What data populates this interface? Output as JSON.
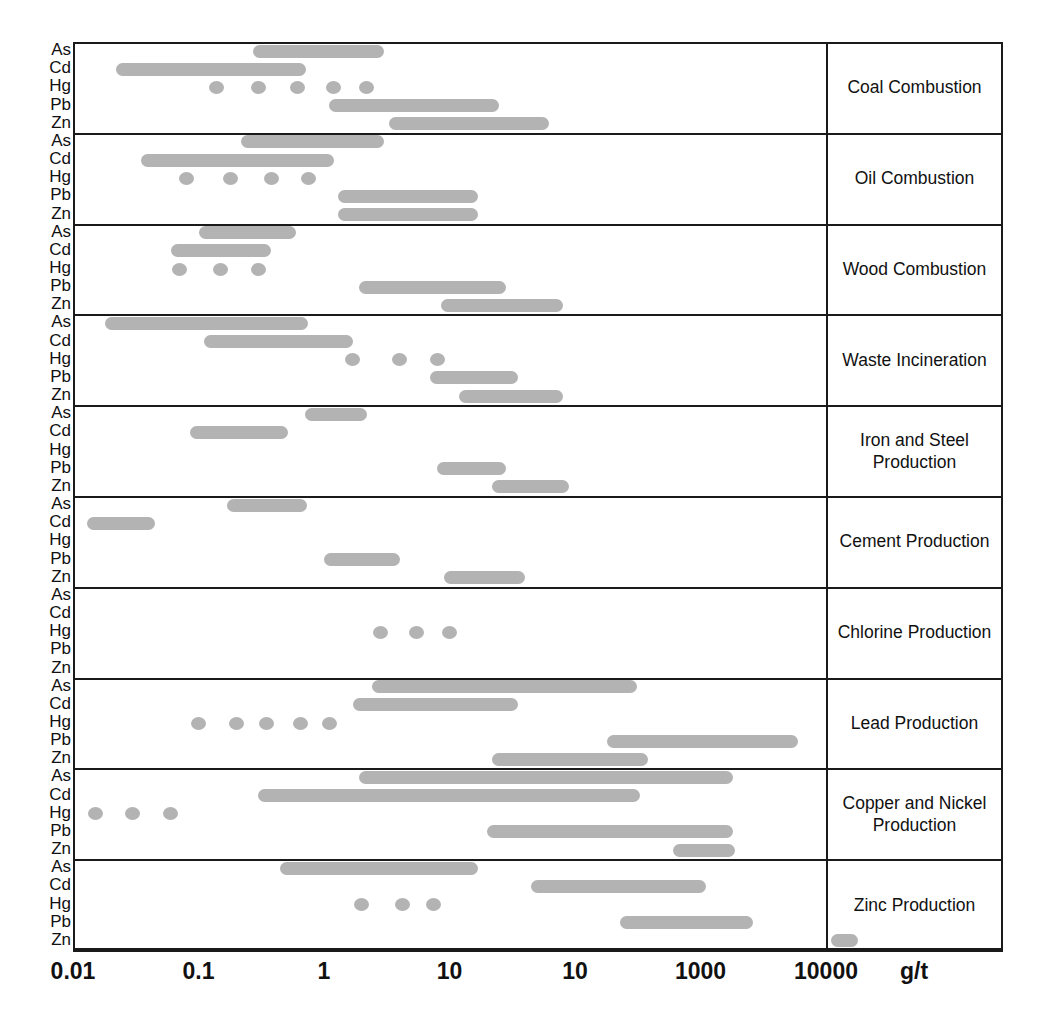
{
  "chart_data": {
    "type": "bar",
    "subtype": "horizontal-range-bars",
    "title": "",
    "xlabel": "g/t",
    "ylabel": "",
    "xscale": "log",
    "xlim": [
      0.01,
      100000
    ],
    "grid": false,
    "legend": "none",
    "axis_tick_labels": [
      "0.01",
      "0.1",
      "1",
      "10",
      "10",
      "1000",
      "10000"
    ],
    "axis_tick_values": [
      0.01,
      0.1,
      1,
      10,
      100,
      1000,
      10000
    ],
    "unit_label": "g/t",
    "metals": [
      "As",
      "Cd",
      "Hg",
      "Pb",
      "Zn"
    ],
    "note": "Fifth x tick is printed as '10' in the source figure although its position corresponds to 100.",
    "bar_color": "#b3b3b3",
    "frame_color": "#1a1a1a",
    "categories": [
      "Coal Combustion",
      "Oil Combustion",
      "Wood Combustion",
      "Waste Incineration",
      "Iron and Steel Production",
      "Cement Production",
      "Chlorine Production",
      "Lead Production",
      "Copper and Nickel Production",
      "Zinc Production"
    ],
    "series": [
      {
        "category": "Coal Combustion",
        "rows": [
          {
            "metal": "As",
            "style": "range",
            "min": 0.27,
            "max": 3.0
          },
          {
            "metal": "Cd",
            "style": "range",
            "min": 0.022,
            "max": 0.72
          },
          {
            "metal": "Hg",
            "style": "dots",
            "points": [
              0.14,
              0.3,
              0.62,
              1.2,
              2.2
            ]
          },
          {
            "metal": "Pb",
            "style": "range",
            "min": 1.1,
            "max": 25
          },
          {
            "metal": "Zn",
            "style": "range",
            "min": 3.3,
            "max": 62
          }
        ]
      },
      {
        "category": "Oil Combustion",
        "rows": [
          {
            "metal": "As",
            "style": "range",
            "min": 0.22,
            "max": 3.0
          },
          {
            "metal": "Cd",
            "style": "range",
            "min": 0.035,
            "max": 1.2
          },
          {
            "metal": "Hg",
            "style": "dots",
            "points": [
              0.08,
              0.18,
              0.38,
              0.75
            ]
          },
          {
            "metal": "Pb",
            "style": "range",
            "min": 1.3,
            "max": 17
          },
          {
            "metal": "Zn",
            "style": "range",
            "min": 1.3,
            "max": 17
          }
        ]
      },
      {
        "category": "Wood Combustion",
        "rows": [
          {
            "metal": "As",
            "style": "range",
            "min": 0.1,
            "max": 0.6
          },
          {
            "metal": "Cd",
            "style": "range",
            "min": 0.06,
            "max": 0.38
          },
          {
            "metal": "Hg",
            "style": "dots",
            "points": [
              0.07,
              0.15,
              0.3
            ]
          },
          {
            "metal": "Pb",
            "style": "range",
            "min": 1.9,
            "max": 28
          },
          {
            "metal": "Zn",
            "style": "range",
            "min": 8.5,
            "max": 80
          }
        ]
      },
      {
        "category": "Waste Incineration",
        "rows": [
          {
            "metal": "As",
            "style": "range",
            "min": 0.018,
            "max": 0.75
          },
          {
            "metal": "Cd",
            "style": "range",
            "min": 0.11,
            "max": 1.7
          },
          {
            "metal": "Hg",
            "style": "dots",
            "points": [
              1.7,
              4.0,
              8.0
            ]
          },
          {
            "metal": "Pb",
            "style": "range",
            "min": 7.0,
            "max": 35
          },
          {
            "metal": "Zn",
            "style": "range",
            "min": 12,
            "max": 80
          }
        ]
      },
      {
        "category": "Iron and Steel Production",
        "rows": [
          {
            "metal": "As",
            "style": "range",
            "min": 0.7,
            "max": 2.2
          },
          {
            "metal": "Cd",
            "style": "range",
            "min": 0.085,
            "max": 0.52
          },
          {
            "metal": "Hg",
            "style": "none",
            "points": []
          },
          {
            "metal": "Pb",
            "style": "range",
            "min": 8.0,
            "max": 28
          },
          {
            "metal": "Zn",
            "style": "range",
            "min": 22,
            "max": 90
          }
        ]
      },
      {
        "category": "Cement Production",
        "rows": [
          {
            "metal": "As",
            "style": "range",
            "min": 0.17,
            "max": 0.73
          },
          {
            "metal": "Cd",
            "style": "range",
            "min": 0.013,
            "max": 0.045
          },
          {
            "metal": "Hg",
            "style": "none",
            "points": []
          },
          {
            "metal": "Pb",
            "style": "range",
            "min": 1.0,
            "max": 4.0
          },
          {
            "metal": "Zn",
            "style": "range",
            "min": 9.0,
            "max": 40
          }
        ]
      },
      {
        "category": "Chlorine Production",
        "rows": [
          {
            "metal": "As",
            "style": "none",
            "points": []
          },
          {
            "metal": "Cd",
            "style": "none",
            "points": []
          },
          {
            "metal": "Hg",
            "style": "dots",
            "points": [
              2.8,
              5.5,
              10
            ]
          },
          {
            "metal": "Pb",
            "style": "none",
            "points": []
          },
          {
            "metal": "Zn",
            "style": "none",
            "points": []
          }
        ]
      },
      {
        "category": "Lead Production",
        "rows": [
          {
            "metal": "As",
            "style": "range",
            "min": 2.4,
            "max": 310
          },
          {
            "metal": "Cd",
            "style": "range",
            "min": 1.7,
            "max": 35
          },
          {
            "metal": "Hg",
            "style": "dots",
            "points": [
              0.1,
              0.2,
              0.35,
              0.65,
              1.1
            ]
          },
          {
            "metal": "Pb",
            "style": "range",
            "min": 180,
            "max": 6000
          },
          {
            "metal": "Zn",
            "style": "range",
            "min": 22,
            "max": 380
          }
        ]
      },
      {
        "category": "Copper and Nickel Production",
        "rows": [
          {
            "metal": "As",
            "style": "range",
            "min": 1.9,
            "max": 1800
          },
          {
            "metal": "Cd",
            "style": "range",
            "min": 0.3,
            "max": 330
          },
          {
            "metal": "Hg",
            "style": "dots",
            "points": [
              0.015,
              0.03,
              0.06
            ]
          },
          {
            "metal": "Pb",
            "style": "range",
            "min": 20,
            "max": 1800
          },
          {
            "metal": "Zn",
            "style": "range",
            "min": 600,
            "max": 1900
          }
        ]
      },
      {
        "category": "Zinc Production",
        "rows": [
          {
            "metal": "As",
            "style": "range",
            "min": 0.45,
            "max": 17
          },
          {
            "metal": "Cd",
            "style": "range",
            "min": 45,
            "max": 1100
          },
          {
            "metal": "Hg",
            "style": "dots",
            "points": [
              2.0,
              4.2,
              7.5
            ]
          },
          {
            "metal": "Pb",
            "style": "range",
            "min": 230,
            "max": 2600
          },
          {
            "metal": "Zn",
            "style": "range",
            "min": 11000,
            "max": 18000
          }
        ]
      }
    ]
  }
}
